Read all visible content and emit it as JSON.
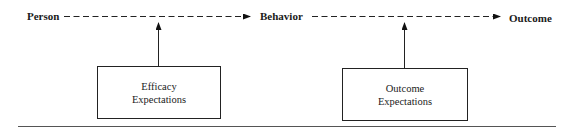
{
  "diagram": {
    "nodes": {
      "person": "Person",
      "behavior": "Behavior",
      "outcome": "Outcome"
    },
    "boxes": {
      "efficacy": [
        "Efficacy",
        "Expectations"
      ],
      "outcome_exp": [
        "Outcome",
        "Expectations"
      ]
    },
    "edges": [
      {
        "from": "Person",
        "to": "Behavior",
        "style": "dashed"
      },
      {
        "from": "Behavior",
        "to": "Outcome",
        "style": "dashed"
      },
      {
        "from": "Efficacy Expectations",
        "to": "Person-Behavior link",
        "style": "solid"
      },
      {
        "from": "Outcome Expectations",
        "to": "Behavior-Outcome link",
        "style": "solid"
      }
    ]
  }
}
